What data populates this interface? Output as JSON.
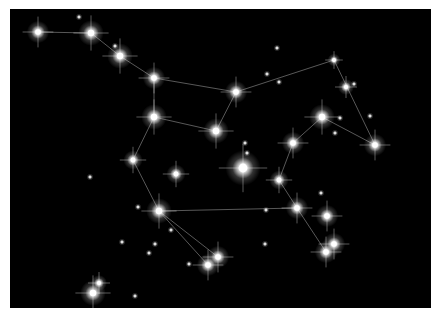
{
  "canvas": {
    "width": 441,
    "height": 316,
    "sky_color": "#000000",
    "border_color": "#ffffff",
    "sky_rect": [
      10,
      9,
      421,
      299
    ]
  },
  "colors": {
    "star": "#ffffff",
    "line": "#6e6e6e",
    "glow": "#ffffff"
  },
  "bright_stars": [
    [
      38,
      32,
      7
    ],
    [
      91,
      33,
      8
    ],
    [
      120,
      56,
      8
    ],
    [
      154,
      78,
      7
    ],
    [
      236,
      92,
      7
    ],
    [
      334,
      60,
      4
    ],
    [
      346,
      87,
      5
    ],
    [
      375,
      145,
      7
    ],
    [
      322,
      117,
      8
    ],
    [
      293,
      143,
      7
    ],
    [
      279,
      180,
      6
    ],
    [
      297,
      208,
      7
    ],
    [
      327,
      216,
      7
    ],
    [
      334,
      244,
      7
    ],
    [
      326,
      252,
      7
    ],
    [
      216,
      131,
      8
    ],
    [
      154,
      117,
      8
    ],
    [
      133,
      160,
      6
    ],
    [
      159,
      211,
      8
    ],
    [
      208,
      265,
      7
    ],
    [
      218,
      257,
      7
    ],
    [
      243,
      168,
      11
    ],
    [
      176,
      174,
      6
    ],
    [
      93,
      293,
      8
    ],
    [
      99,
      283,
      5
    ]
  ],
  "faint_stars": [
    [
      79,
      17
    ],
    [
      115,
      46
    ],
    [
      277,
      48
    ],
    [
      267,
      74
    ],
    [
      279,
      82
    ],
    [
      354,
      84
    ],
    [
      370,
      116
    ],
    [
      340,
      118
    ],
    [
      335,
      133
    ],
    [
      245,
      143
    ],
    [
      247,
      153
    ],
    [
      321,
      193
    ],
    [
      266,
      210
    ],
    [
      265,
      244
    ],
    [
      90,
      177
    ],
    [
      138,
      207
    ],
    [
      171,
      230
    ],
    [
      155,
      244
    ],
    [
      122,
      242
    ],
    [
      149,
      253
    ],
    [
      189,
      264
    ],
    [
      135,
      296
    ]
  ],
  "lines": [
    [
      38,
      32,
      91,
      33
    ],
    [
      91,
      33,
      120,
      56
    ],
    [
      120,
      56,
      154,
      78
    ],
    [
      154,
      78,
      236,
      92
    ],
    [
      236,
      92,
      334,
      60
    ],
    [
      334,
      60,
      375,
      145
    ],
    [
      375,
      145,
      322,
      117
    ],
    [
      322,
      117,
      293,
      143
    ],
    [
      293,
      143,
      279,
      180
    ],
    [
      279,
      180,
      297,
      208
    ],
    [
      297,
      208,
      326,
      252
    ],
    [
      236,
      92,
      216,
      131
    ],
    [
      154,
      78,
      154,
      117
    ],
    [
      154,
      117,
      216,
      131
    ],
    [
      154,
      117,
      133,
      160
    ],
    [
      133,
      160,
      159,
      211
    ],
    [
      159,
      211,
      297,
      208
    ],
    [
      159,
      211,
      208,
      265
    ],
    [
      159,
      211,
      218,
      257
    ]
  ]
}
